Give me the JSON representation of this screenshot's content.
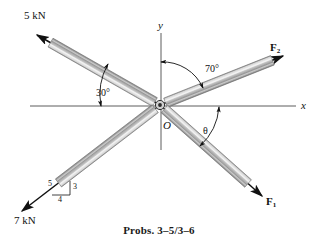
{
  "figure": {
    "caption": "Probs. 3–5/3–6",
    "origin_label": "O",
    "axes": {
      "x_label": "x",
      "y_label": "y"
    },
    "forces": [
      {
        "id": "force-5kn",
        "label": "5 kN",
        "direction": "upper-left",
        "angle_from_x_axis_deg": 30
      },
      {
        "id": "force-f2",
        "label": "F₂",
        "label_base": "F",
        "label_sub": "2",
        "direction": "upper-right",
        "angle_from_y_axis_deg": 70
      },
      {
        "id": "force-f1",
        "label": "F₁",
        "label_base": "F",
        "label_sub": "1",
        "direction": "lower-right",
        "angle_from_x_axis": "theta"
      },
      {
        "id": "force-7kn",
        "label": "7 kN",
        "direction": "lower-left",
        "slope": "3-4-5"
      }
    ],
    "angles": [
      {
        "id": "angle-30",
        "label": "30°",
        "measured_from": "x-axis"
      },
      {
        "id": "angle-70",
        "label": "70°",
        "measured_from": "y-axis"
      },
      {
        "id": "angle-theta",
        "label": "θ",
        "measured_from": "x-axis"
      }
    ],
    "slope_triangle": {
      "hypotenuse_label": "5",
      "vertical_label": "3",
      "horizontal_label": "4"
    },
    "colors": {
      "line": "#111111",
      "member_light": "#e8e8e8",
      "member_mid": "#b4b4b4",
      "member_dark": "#8a8a8a",
      "axis": "#555555",
      "background": "#ffffff"
    }
  }
}
